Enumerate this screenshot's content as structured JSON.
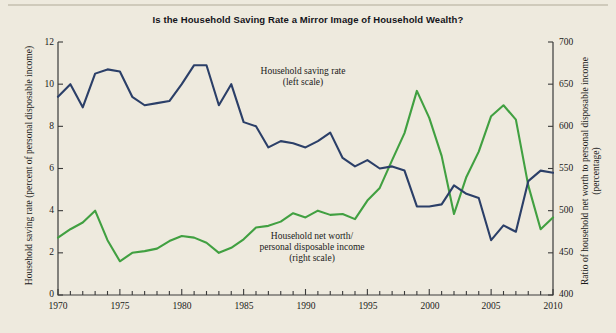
{
  "figure": {
    "title": "Is the Household Saving Rate a Mirror Image of Household Wealth?",
    "background_color": "#eeeade",
    "saving_rate_color": "#2b3f68",
    "net_worth_color": "#41a041"
  },
  "annotations": {
    "saving_rate": "Household saving rate\n(left scale)",
    "net_worth": "Household net worth/\npersonal disposable income\n(right scale)"
  },
  "axes": {
    "y_left_title": "Household saving rate (percent of personal disposable income)",
    "y_right_title": "Ratio of household net worth to personal disposable income (percentage)",
    "y_left_ticks": [
      "0",
      "2",
      "4",
      "6",
      "8",
      "10",
      "12"
    ],
    "y_right_ticks": [
      "400",
      "450",
      "500",
      "550",
      "600",
      "650",
      "700"
    ],
    "x_ticks": [
      "1970",
      "1975",
      "1980",
      "1985",
      "1990",
      "1995",
      "2000",
      "2005",
      "2010"
    ]
  },
  "chart_data": {
    "type": "line",
    "title": "Is the Household Saving Rate a Mirror Image of Household Wealth?",
    "xlabel": "",
    "ylabel": "Household saving rate (percent of personal disposable income)",
    "ylabel_right": "Ratio of household net worth to personal disposable income (percentage)",
    "xlim": [
      1970,
      2010
    ],
    "ylim": [
      0,
      12
    ],
    "ylim_right": [
      400,
      700
    ],
    "grid": false,
    "legend_position": "inline-annotations",
    "x": [
      1970,
      1971,
      1972,
      1973,
      1974,
      1975,
      1976,
      1977,
      1978,
      1979,
      1980,
      1981,
      1982,
      1983,
      1984,
      1985,
      1986,
      1987,
      1988,
      1989,
      1990,
      1991,
      1992,
      1993,
      1994,
      1995,
      1996,
      1997,
      1998,
      1999,
      2000,
      2001,
      2002,
      2003,
      2004,
      2005,
      2006,
      2007,
      2008,
      2009,
      2010
    ],
    "series": [
      {
        "name": "Household saving rate (left scale)",
        "axis": "left",
        "color": "#2b3f68",
        "units": "percent of personal disposable income",
        "values": [
          9.4,
          10.0,
          8.9,
          10.5,
          10.7,
          10.6,
          9.4,
          9.0,
          9.1,
          9.2,
          10.0,
          10.9,
          10.9,
          9.0,
          10.0,
          8.2,
          8.0,
          7.0,
          7.3,
          7.2,
          7.0,
          7.3,
          7.7,
          6.5,
          6.1,
          6.4,
          6.0,
          6.1,
          5.9,
          4.2,
          4.2,
          4.3,
          5.2,
          4.8,
          4.6,
          2.6,
          3.3,
          3.0,
          5.4,
          5.9,
          5.8
        ]
      },
      {
        "name": "Household net worth/personal disposable income (right scale)",
        "axis": "right",
        "color": "#41a041",
        "units": "percentage",
        "values": [
          468,
          478,
          486,
          500,
          465,
          440,
          450,
          452,
          455,
          464,
          470,
          468,
          462,
          450,
          456,
          466,
          480,
          482,
          487,
          497,
          492,
          500,
          495,
          496,
          490,
          512,
          527,
          560,
          592,
          642,
          610,
          565,
          496,
          540,
          570,
          612,
          625,
          608,
          530,
          478,
          492
        ]
      }
    ]
  }
}
